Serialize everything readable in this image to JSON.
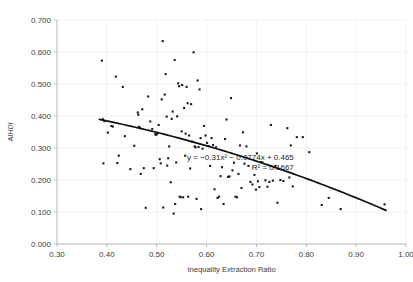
{
  "chart_data": {
    "type": "scatter",
    "title": "",
    "xlabel": "Inequality Extraction Ratio",
    "ylabel": "AIHDI",
    "xlim": [
      0.3,
      1.0
    ],
    "ylim": [
      0.0,
      0.7
    ],
    "xticks": [
      0.3,
      0.4,
      0.5,
      0.6,
      0.7,
      0.8,
      0.9,
      1.0
    ],
    "xtick_labels": [
      "0.30",
      "0.40",
      "0.50",
      "0.60",
      "0.70",
      "0.80",
      "0.90",
      "1.00"
    ],
    "yticks": [
      0.0,
      0.1,
      0.2,
      0.3,
      0.4,
      0.5,
      0.6,
      0.7
    ],
    "ytick_labels": [
      "0.000",
      "0.100",
      "0.200",
      "0.300",
      "0.400",
      "0.500",
      "0.600",
      "0.700"
    ],
    "grid": "both-faint",
    "legend": "none",
    "marker_shape": "square",
    "marker_color": "#1a1a1a",
    "annotations": [
      {
        "name": "trendline-equation",
        "text": "y = −0.31x² − 0.0774x + 0.465",
        "x": 0.775,
        "y": 0.262
      },
      {
        "name": "r-squared",
        "text": "R² = 0.1667",
        "x": 0.775,
        "y": 0.232
      }
    ],
    "trendline": {
      "type": "polynomial",
      "degree": 2,
      "equation": "y = −0.31x² − 0.0774x + 0.465",
      "r_squared": 0.1667,
      "coefficients": {
        "a": -0.31,
        "b": -0.0774,
        "c": 0.465
      },
      "x_start": 0.385,
      "x_end": 0.96,
      "color": "#111111"
    },
    "points": [
      [
        0.39,
        0.573
      ],
      [
        0.392,
        0.39
      ],
      [
        0.395,
        0.384
      ],
      [
        0.393,
        0.252
      ],
      [
        0.402,
        0.348
      ],
      [
        0.409,
        0.369
      ],
      [
        0.412,
        0.367
      ],
      [
        0.418,
        0.523
      ],
      [
        0.421,
        0.253
      ],
      [
        0.424,
        0.276
      ],
      [
        0.432,
        0.491
      ],
      [
        0.436,
        0.337
      ],
      [
        0.447,
        0.234
      ],
      [
        0.455,
        0.307
      ],
      [
        0.462,
        0.411
      ],
      [
        0.463,
        0.404
      ],
      [
        0.464,
        0.366
      ],
      [
        0.466,
        0.364
      ],
      [
        0.468,
        0.219
      ],
      [
        0.471,
        0.421
      ],
      [
        0.474,
        0.237
      ],
      [
        0.478,
        0.113
      ],
      [
        0.483,
        0.461
      ],
      [
        0.487,
        0.383
      ],
      [
        0.491,
        0.359
      ],
      [
        0.494,
        0.237
      ],
      [
        0.497,
        0.343
      ],
      [
        0.499,
        0.341
      ],
      [
        0.501,
        0.345
      ],
      [
        0.504,
        0.372
      ],
      [
        0.506,
        0.265
      ],
      [
        0.508,
        0.252
      ],
      [
        0.51,
        0.452
      ],
      [
        0.512,
        0.634
      ],
      [
        0.513,
        0.114
      ],
      [
        0.516,
        0.467
      ],
      [
        0.518,
        0.531
      ],
      [
        0.52,
        0.398
      ],
      [
        0.521,
        0.245
      ],
      [
        0.523,
        0.268
      ],
      [
        0.525,
        0.305
      ],
      [
        0.528,
        0.193
      ],
      [
        0.53,
        0.391
      ],
      [
        0.532,
        0.414
      ],
      [
        0.534,
        0.095
      ],
      [
        0.536,
        0.575
      ],
      [
        0.537,
        0.125
      ],
      [
        0.539,
        0.255
      ],
      [
        0.541,
        0.399
      ],
      [
        0.543,
        0.502
      ],
      [
        0.545,
        0.493
      ],
      [
        0.546,
        0.148
      ],
      [
        0.548,
        0.146
      ],
      [
        0.55,
        0.352
      ],
      [
        0.551,
        0.497
      ],
      [
        0.553,
        0.146
      ],
      [
        0.555,
        0.425
      ],
      [
        0.557,
        0.276
      ],
      [
        0.558,
        0.345
      ],
      [
        0.56,
        0.491
      ],
      [
        0.562,
        0.44
      ],
      [
        0.563,
        0.148
      ],
      [
        0.565,
        0.339
      ],
      [
        0.567,
        0.236
      ],
      [
        0.569,
        0.437
      ],
      [
        0.571,
        0.32
      ],
      [
        0.574,
        0.599
      ],
      [
        0.576,
        0.305
      ],
      [
        0.578,
        0.302
      ],
      [
        0.58,
        0.141
      ],
      [
        0.582,
        0.511
      ],
      [
        0.584,
        0.303
      ],
      [
        0.586,
        0.483
      ],
      [
        0.588,
        0.331
      ],
      [
        0.589,
        0.109
      ],
      [
        0.592,
        0.298
      ],
      [
        0.595,
        0.369
      ],
      [
        0.598,
        0.339
      ],
      [
        0.601,
        0.316
      ],
      [
        0.604,
        0.306
      ],
      [
        0.607,
        0.244
      ],
      [
        0.61,
        0.331
      ],
      [
        0.613,
        0.309
      ],
      [
        0.616,
        0.171
      ],
      [
        0.619,
        0.302
      ],
      [
        0.622,
        0.144
      ],
      [
        0.625,
        0.148
      ],
      [
        0.628,
        0.212
      ],
      [
        0.631,
        0.24
      ],
      [
        0.634,
        0.125
      ],
      [
        0.637,
        0.328
      ],
      [
        0.64,
        0.389
      ],
      [
        0.643,
        0.21
      ],
      [
        0.646,
        0.211
      ],
      [
        0.649,
        0.456
      ],
      [
        0.652,
        0.23
      ],
      [
        0.655,
        0.254
      ],
      [
        0.658,
        0.148
      ],
      [
        0.661,
        0.146
      ],
      [
        0.664,
        0.219
      ],
      [
        0.667,
        0.308
      ],
      [
        0.67,
        0.175
      ],
      [
        0.673,
        0.349
      ],
      [
        0.676,
        0.251
      ],
      [
        0.68,
        0.305
      ],
      [
        0.684,
        0.244
      ],
      [
        0.688,
        0.194
      ],
      [
        0.692,
        0.186
      ],
      [
        0.696,
        0.216
      ],
      [
        0.699,
        0.17
      ],
      [
        0.701,
        0.283
      ],
      [
        0.703,
        0.196
      ],
      [
        0.706,
        0.178
      ],
      [
        0.709,
        0.256
      ],
      [
        0.712,
        0.255
      ],
      [
        0.718,
        0.199
      ],
      [
        0.722,
        0.179
      ],
      [
        0.726,
        0.194
      ],
      [
        0.729,
        0.372
      ],
      [
        0.733,
        0.198
      ],
      [
        0.738,
        0.244
      ],
      [
        0.742,
        0.129
      ],
      [
        0.748,
        0.2
      ],
      [
        0.754,
        0.197
      ],
      [
        0.762,
        0.362
      ],
      [
        0.766,
        0.208
      ],
      [
        0.769,
        0.308
      ],
      [
        0.773,
        0.18
      ],
      [
        0.781,
        0.334
      ],
      [
        0.793,
        0.334
      ],
      [
        0.806,
        0.287
      ],
      [
        0.831,
        0.122
      ],
      [
        0.845,
        0.144
      ],
      [
        0.869,
        0.109
      ],
      [
        0.957,
        0.124
      ]
    ]
  }
}
